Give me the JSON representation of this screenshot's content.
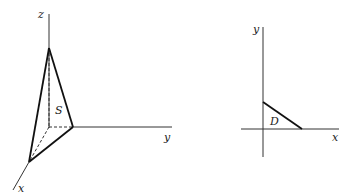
{
  "figure_left": {
    "title": "3D surface S",
    "labels": {
      "z": "z",
      "y": "y",
      "x": "x",
      "surface": "S"
    }
  },
  "figure_right": {
    "title": "Projection region D",
    "labels": {
      "y": "y",
      "x": "x",
      "region": "D"
    }
  },
  "colors": {
    "line": "#222222",
    "background": "#ffffff"
  }
}
